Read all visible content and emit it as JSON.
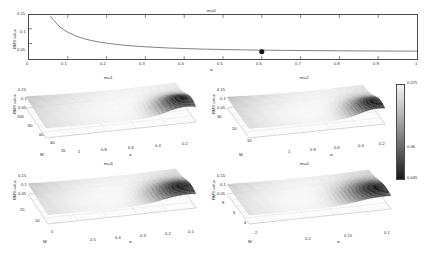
{
  "figure": {
    "colormap_name": "grayscale-jet",
    "background": "#ffffff"
  },
  "colorbar": {
    "name": "rms-colorbar",
    "top_label": "0.075",
    "mid_label": "0.06",
    "bottom_label": "0.045",
    "min": 0.045,
    "max": 0.075
  },
  "panels": [
    {
      "id": "m0",
      "title": "m=0",
      "type": "line",
      "xlabel": "σ",
      "ylabel": "RMS value",
      "xticks": [
        "0",
        "0.1",
        "0.2",
        "0.3",
        "0.4",
        "0.5",
        "0.6",
        "0.7",
        "0.8",
        "0.9",
        "1"
      ],
      "yticks": [
        "0.05",
        "0.1",
        "0.15"
      ],
      "xlim": [
        0,
        1
      ],
      "ylim": [
        0.03,
        0.155
      ],
      "marker": {
        "name": "optimum-marker",
        "x": 0.6,
        "y": 0.0505,
        "label": ""
      },
      "curve_x": [
        0.055,
        0.06,
        0.07,
        0.08,
        0.09,
        0.1,
        0.12,
        0.14,
        0.16,
        0.18,
        0.2,
        0.24,
        0.28,
        0.32,
        0.36,
        0.4,
        0.45,
        0.5,
        0.55,
        0.6,
        0.65,
        0.7,
        0.75,
        0.8,
        0.85,
        0.9,
        0.95,
        1.0
      ],
      "curve_y": [
        0.152,
        0.145,
        0.132,
        0.121,
        0.113,
        0.106,
        0.0955,
        0.0882,
        0.0826,
        0.0784,
        0.0749,
        0.0697,
        0.0661,
        0.0634,
        0.0613,
        0.0597,
        0.0581,
        0.0569,
        0.056,
        0.0552,
        0.0546,
        0.0541,
        0.0537,
        0.0533,
        0.053,
        0.0527,
        0.0525,
        0.0523
      ]
    },
    {
      "id": "m1",
      "title": "m=1",
      "type": "surface",
      "xlabel": "σ",
      "ylabel": "M",
      "zlabel": "RMS value",
      "xticks": [
        "1",
        "0.8",
        "0.6",
        "0.4",
        "0.2"
      ],
      "yticks": [
        "100",
        "80",
        "60",
        "40",
        "20"
      ],
      "zticks": [
        "0.05",
        "0.1",
        "0.15"
      ],
      "zlim": [
        0.03,
        0.155
      ]
    },
    {
      "id": "m2",
      "title": "m=2",
      "type": "surface",
      "xlabel": "σ",
      "ylabel": "M",
      "zlabel": "RMS value",
      "xticks": [
        "1",
        "0.8",
        "0.6",
        "0.4",
        "0.2"
      ],
      "yticks": [
        "30",
        "20",
        "10"
      ],
      "zticks": [
        "0.05",
        "0.1",
        "0.15"
      ],
      "zlim": [
        0.03,
        0.155
      ]
    },
    {
      "id": "m3",
      "title": "m=3",
      "type": "surface",
      "xlabel": "σ",
      "ylabel": "M",
      "zlabel": "RMS value",
      "xticks": [
        "0.5",
        "0.4",
        "0.3",
        "0.2",
        "0.1"
      ],
      "yticks": [
        "15",
        "10",
        "5"
      ],
      "zticks": [
        "0.05",
        "0.1",
        "0.15"
      ],
      "zlim": [
        0.03,
        0.155
      ]
    },
    {
      "id": "m4",
      "title": "m=4",
      "type": "surface",
      "xlabel": "σ",
      "ylabel": "M",
      "zlabel": "RMS value",
      "xticks": [
        "0.2",
        "0.15",
        "0.1"
      ],
      "yticks": [
        "8",
        "6",
        "4",
        "2"
      ],
      "zticks": [
        "0.05",
        "0.1",
        "0.15"
      ],
      "zlim": [
        0.03,
        0.155
      ]
    }
  ],
  "chart_data": {
    "type": "line",
    "xlabel": "σ",
    "ylabel": "RMS value",
    "subplots": [
      {
        "title": "m=0",
        "type": "line",
        "xlabel": "σ",
        "ylabel": "RMS value",
        "xlim": [
          0,
          1
        ],
        "ylim": [
          0.03,
          0.155
        ],
        "xticks": [
          0,
          0.1,
          0.2,
          0.3,
          0.4,
          0.5,
          0.6,
          0.7,
          0.8,
          0.9,
          1
        ],
        "yticks": [
          0.05,
          0.1,
          0.15
        ],
        "grid": false,
        "series": [
          {
            "name": "RMS curve",
            "x": [
              0.055,
              0.06,
              0.07,
              0.08,
              0.09,
              0.1,
              0.12,
              0.14,
              0.16,
              0.18,
              0.2,
              0.24,
              0.28,
              0.32,
              0.36,
              0.4,
              0.45,
              0.5,
              0.55,
              0.6,
              0.65,
              0.7,
              0.75,
              0.8,
              0.85,
              0.9,
              0.95,
              1.0
            ],
            "y": [
              0.152,
              0.145,
              0.132,
              0.121,
              0.113,
              0.106,
              0.0955,
              0.0882,
              0.0826,
              0.0784,
              0.0749,
              0.0697,
              0.0661,
              0.0634,
              0.0613,
              0.0597,
              0.0581,
              0.0569,
              0.056,
              0.0552,
              0.0546,
              0.0541,
              0.0537,
              0.0533,
              0.053,
              0.0527,
              0.0525,
              0.0523
            ]
          },
          {
            "name": "optimum marker",
            "x": [
              0.6
            ],
            "y": [
              0.0505
            ],
            "marker": "filled-circle"
          }
        ]
      },
      {
        "title": "m=1",
        "type": "surface",
        "xlabel": "σ",
        "ylabel": "M",
        "zlabel": "RMS value",
        "xlim": [
          0.2,
          1
        ],
        "ylim": [
          20,
          100
        ],
        "zlim": [
          0.03,
          0.155
        ],
        "xticks": [
          1,
          0.8,
          0.6,
          0.4,
          0.2
        ],
        "yticks": [
          100,
          80,
          60,
          40,
          20
        ],
        "zticks": [
          0.05,
          0.1,
          0.15
        ],
        "colorbar_range": [
          0.045,
          0.075
        ]
      },
      {
        "title": "m=2",
        "type": "surface",
        "xlabel": "σ",
        "ylabel": "M",
        "zlabel": "RMS value",
        "xlim": [
          0.2,
          1
        ],
        "ylim": [
          10,
          30
        ],
        "zlim": [
          0.03,
          0.155
        ],
        "xticks": [
          1,
          0.8,
          0.6,
          0.4,
          0.2
        ],
        "yticks": [
          30,
          20,
          10
        ],
        "zticks": [
          0.05,
          0.1,
          0.15
        ],
        "colorbar_range": [
          0.045,
          0.075
        ]
      },
      {
        "title": "m=3",
        "type": "surface",
        "xlabel": "σ",
        "ylabel": "M",
        "zlabel": "RMS value",
        "xlim": [
          0.1,
          0.5
        ],
        "ylim": [
          5,
          15
        ],
        "zlim": [
          0.03,
          0.155
        ],
        "xticks": [
          0.5,
          0.4,
          0.3,
          0.2,
          0.1
        ],
        "yticks": [
          15,
          10,
          5
        ],
        "zticks": [
          0.05,
          0.1,
          0.15
        ],
        "colorbar_range": [
          0.045,
          0.075
        ]
      },
      {
        "title": "m=4",
        "type": "surface",
        "xlabel": "σ",
        "ylabel": "M",
        "zlabel": "RMS value",
        "xlim": [
          0.1,
          0.2
        ],
        "ylim": [
          2,
          8
        ],
        "zlim": [
          0.03,
          0.155
        ],
        "xticks": [
          0.2,
          0.15,
          0.1
        ],
        "yticks": [
          8,
          6,
          4,
          2
        ],
        "zticks": [
          0.05,
          0.1,
          0.15
        ],
        "colorbar_range": [
          0.045,
          0.075
        ]
      }
    ],
    "colorbar": {
      "min": 0.045,
      "max": 0.075,
      "ticks": [
        0.045,
        0.06,
        0.075
      ],
      "position": "right"
    }
  }
}
